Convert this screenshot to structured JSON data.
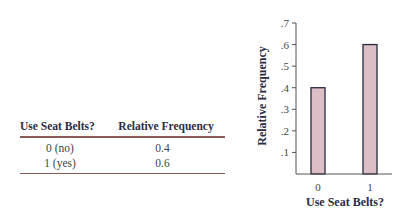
{
  "table": {
    "headers": [
      "Use Seat Belts?",
      "Relative Frequency"
    ],
    "rows": [
      [
        "0 (no)",
        "0.4"
      ],
      [
        "1 (yes)",
        "0.6"
      ]
    ],
    "rule_color": "#8a5b55"
  },
  "chart_data": {
    "type": "bar",
    "categories": [
      "0",
      "1"
    ],
    "values": [
      0.4,
      0.6
    ],
    "title": "",
    "xlabel": "Use Seat Belts?",
    "ylabel": "Relative Frequency",
    "ylim": [
      0,
      0.7
    ],
    "yticks": [
      0.1,
      0.2,
      0.3,
      0.4,
      0.5,
      0.6,
      0.7
    ],
    "ytick_labels": [
      ".1",
      ".2",
      ".3",
      ".4",
      ".5",
      ".6",
      ".7"
    ],
    "grid": false,
    "legend": "none",
    "bar_fill": "#dcbfc6",
    "bar_stroke": "#2a2840",
    "axis_color": "#555555"
  }
}
